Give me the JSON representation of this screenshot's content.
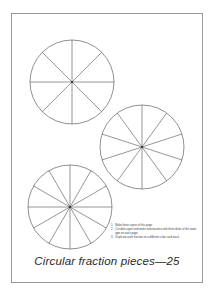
{
  "page": {
    "title_caption": "Circular fraction pieces—25",
    "background_color": "#ffffff",
    "border_color": "#9a9a9a",
    "ink_color": "#4a4a4a"
  },
  "instructions": [
    {
      "number": "1.",
      "text": "Make three copies of this page."
    },
    {
      "number": "2.",
      "text": "Cut disks apart and make new masters with three disks of the same type on each page."
    },
    {
      "number": "3.",
      "text": "Duplicate each fraction on a different color card stock."
    }
  ],
  "chart_data": {
    "type": "pie",
    "title": "Circular fraction pieces—25",
    "xlabel": "",
    "ylabel": "",
    "grid": false,
    "legend": "none",
    "disks": [
      {
        "name": "eighths-disk",
        "sectors": 8,
        "fraction_each": "1/8",
        "center_x": 72,
        "center_y": 82,
        "radius": 42,
        "start_angle_deg": 90,
        "values": [
          12.5,
          12.5,
          12.5,
          12.5,
          12.5,
          12.5,
          12.5,
          12.5
        ],
        "categories": [
          "1/8",
          "1/8",
          "1/8",
          "1/8",
          "1/8",
          "1/8",
          "1/8",
          "1/8"
        ]
      },
      {
        "name": "tenths-disk",
        "sectors": 10,
        "fraction_each": "1/10",
        "center_x": 142,
        "center_y": 147,
        "radius": 42,
        "start_angle_deg": 90,
        "values": [
          10,
          10,
          10,
          10,
          10,
          10,
          10,
          10,
          10,
          10
        ],
        "categories": [
          "1/10",
          "1/10",
          "1/10",
          "1/10",
          "1/10",
          "1/10",
          "1/10",
          "1/10",
          "1/10",
          "1/10"
        ]
      },
      {
        "name": "twelfths-disk",
        "sectors": 12,
        "fraction_each": "1/12",
        "center_x": 70,
        "center_y": 207,
        "radius": 42,
        "start_angle_deg": 90,
        "values": [
          8.333,
          8.333,
          8.333,
          8.333,
          8.333,
          8.333,
          8.333,
          8.333,
          8.333,
          8.333,
          8.333,
          8.333
        ],
        "categories": [
          "1/12",
          "1/12",
          "1/12",
          "1/12",
          "1/12",
          "1/12",
          "1/12",
          "1/12",
          "1/12",
          "1/12",
          "1/12",
          "1/12"
        ]
      }
    ]
  }
}
